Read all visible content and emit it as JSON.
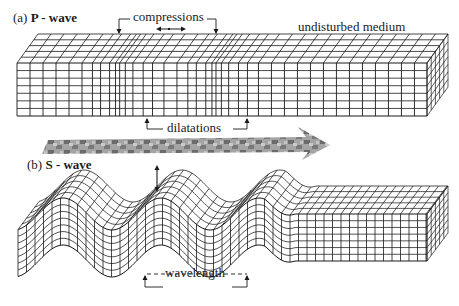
{
  "panel_a": {
    "label_prefix": "(a)",
    "label_title": "P - wave",
    "annotations": {
      "compressions": "compressions",
      "undisturbed": "undisturbed medium",
      "dilatations": "dilatations"
    }
  },
  "panel_b": {
    "label_prefix": "(b)",
    "label_title": "S - wave",
    "annotations": {
      "wavelength": "wavelength"
    }
  },
  "propagation_arrow": {
    "direction": "right"
  },
  "colors": {
    "line": "#1a1a1a",
    "background": "#ffffff",
    "arrow_dark": "#555555",
    "arrow_light": "#b0b0b0"
  }
}
